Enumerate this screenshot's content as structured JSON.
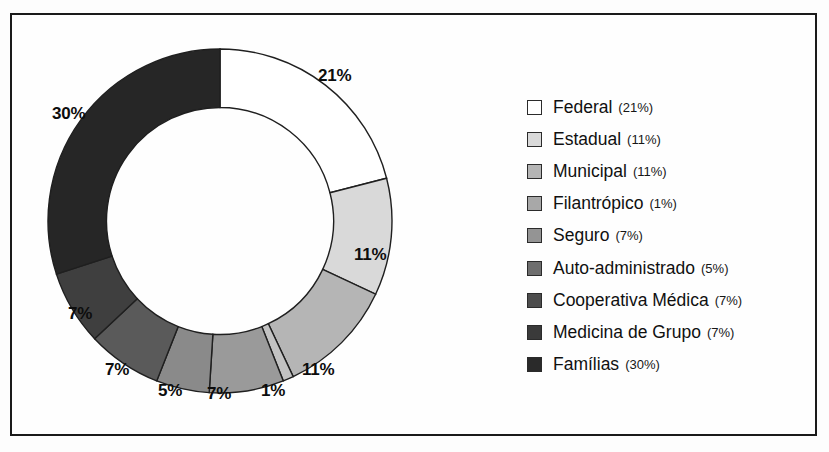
{
  "figure": {
    "border_color": "#1a1a1a",
    "background": "#fefefe"
  },
  "chart_data": {
    "type": "pie",
    "variant": "donut",
    "title": "",
    "xlabel": "",
    "ylabel": "",
    "start_angle_deg": 0,
    "direction": "clockwise",
    "inner_radius_ratio": 0.66,
    "categories": [
      "Federal",
      "Estadual",
      "Municipal",
      "Filantrópico",
      "Seguro",
      "Auto-administrado",
      "Cooperativa Médica",
      "Medicina de Grupo",
      "Famílias"
    ],
    "values": [
      21,
      11,
      11,
      1,
      7,
      5,
      7,
      7,
      30
    ],
    "value_labels": [
      "21%",
      "11%",
      "11%",
      "1%",
      "7%",
      "5%",
      "7%",
      "7%",
      "30%"
    ],
    "colors": [
      "#ffffff",
      "#d9d9d9",
      "#b5b5b5",
      "#c2c2c2",
      "#9a9a9a",
      "#8a8a8a",
      "#5a5a5a",
      "#3f3f3f",
      "#262626"
    ],
    "slice_edge_color": "#1f1f1f",
    "legend_position": "right",
    "grid": false
  },
  "slice_labels": [
    {
      "text": "21%",
      "x": 288,
      "y": 43
    },
    {
      "text": "11%",
      "x": 324,
      "y": 222
    },
    {
      "text": "11%",
      "x": 272,
      "y": 337
    },
    {
      "text": "1%",
      "x": 231,
      "y": 358
    },
    {
      "text": "7%",
      "x": 177,
      "y": 361
    },
    {
      "text": "5%",
      "x": 128,
      "y": 358
    },
    {
      "text": "7%",
      "x": 75,
      "y": 337
    },
    {
      "text": "7%",
      "x": 38,
      "y": 281
    },
    {
      "text": "30%",
      "x": 22,
      "y": 81
    }
  ],
  "legend": {
    "items": [
      {
        "label": "Federal",
        "pct": "(21%)",
        "color": "#ffffff"
      },
      {
        "label": "Estadual",
        "pct": "(11%)",
        "color": "#d9d9d9"
      },
      {
        "label": "Municipal",
        "pct": "(11%)",
        "color": "#b5b5b5"
      },
      {
        "label": "Filantrópico",
        "pct": "(1%)",
        "color": "#a8a8a8"
      },
      {
        "label": "Seguro",
        "pct": "(7%)",
        "color": "#949494"
      },
      {
        "label": "Auto-administrado",
        "pct": "(5%)",
        "color": "#6e6e6e"
      },
      {
        "label": "Cooperativa Médica",
        "pct": "(7%)",
        "color": "#4d4d4d"
      },
      {
        "label": "Medicina de Grupo",
        "pct": "(7%)",
        "color": "#3a3a3a"
      },
      {
        "label": "Famílias",
        "pct": "(30%)",
        "color": "#2a2a2a"
      }
    ]
  }
}
